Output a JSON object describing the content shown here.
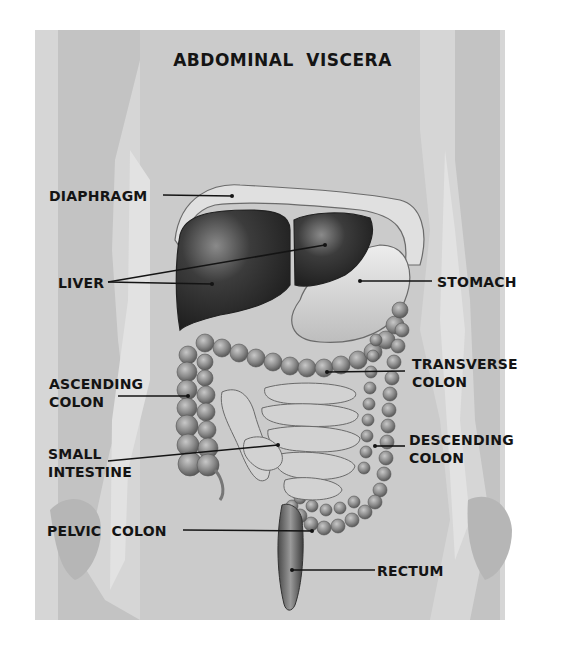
{
  "title": "ABDOMINAL VISCERA",
  "labels": {
    "diaphragm": "DIAPHRAGM",
    "liver": "LIVER",
    "stomach": "STOMACH",
    "ascending_colon_1": "ASCENDING",
    "ascending_colon_2": "COLON",
    "transverse_colon_1": "TRANSVERSE",
    "transverse_colon_2": "COLON",
    "small_intestine_1": "SMALL",
    "small_intestine_2": "INTESTINE",
    "descending_colon_1": "DESCENDING",
    "descending_colon_2": "COLON",
    "pelvic_colon": "PELVIC  COLON",
    "rectum": "RECTUM"
  },
  "colors": {
    "plate": "#d6d6d6",
    "body_silhouette": "#c4c4c4",
    "liver": "#3a3a3a",
    "stomach": "#dcdcdc",
    "colon": "#8e8e8e",
    "intestine": "#cfcfcf",
    "text": "#141414"
  }
}
